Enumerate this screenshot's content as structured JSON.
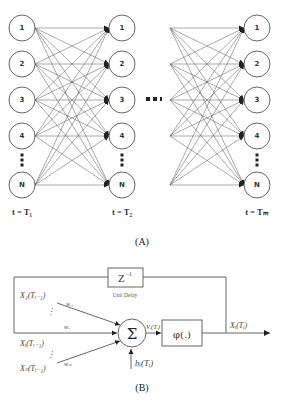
{
  "panel_a": {
    "caption": "(A)",
    "node_labels": [
      "1",
      "2",
      "3",
      "4",
      "N"
    ],
    "columns": [
      {
        "time_label": "t = T₁",
        "x": 22
      },
      {
        "time_label": "t = T₂",
        "x": 122
      },
      {
        "time_label": "t = Tₘ",
        "x": 257
      }
    ],
    "ellipsis": "■■▪",
    "vertical_ellipsis": "⋮"
  },
  "panel_b": {
    "caption": "(B)",
    "delay_box": {
      "label": "Z",
      "superscript": "-1",
      "sublabel": "Unit Delay"
    },
    "summation_symbol": "Σ",
    "activation_box": {
      "label": "φ(.)"
    },
    "inputs": [
      {
        "label": "X₁(Tᵢ₋₁)",
        "weight": "wᵢ₁"
      },
      {
        "label": "Xᵢ(Tᵢ₋₁)",
        "weight": "wᵢᵢ"
      },
      {
        "label": "Xₙ(Tᵢ₋₁)",
        "weight": "wᵢₙ"
      }
    ],
    "bias_label": "bᵢ(Tᵢ)",
    "net_label": "Vᵢ(Tᵢ)",
    "output_label": "Xᵢ(Tᵢ)"
  }
}
